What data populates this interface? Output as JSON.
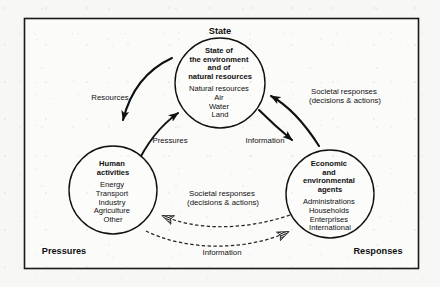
{
  "figure": {
    "frame_color": "#1a1a1a",
    "background_color": "#f7f7f5",
    "text_color": "#111111"
  },
  "corner_labels": {
    "top": "State",
    "bottom_left": "Pressures",
    "bottom_right": "Responses"
  },
  "nodes": [
    {
      "id": "state",
      "heading_lines": [
        "State of",
        "the environment",
        "and of",
        "natural resources"
      ],
      "item_lines": [
        "Natural resources",
        "Air",
        "Water",
        "Land"
      ]
    },
    {
      "id": "human-activities",
      "heading_lines": [
        "Human",
        "activities"
      ],
      "item_lines": [
        "Energy",
        "Transport",
        "Industry",
        "Agriculture",
        "Other"
      ]
    },
    {
      "id": "agents",
      "heading_lines": [
        "Economic",
        "and",
        "environmental",
        "agents"
      ],
      "item_lines": [
        "Administrations",
        "Households",
        "Enterprises",
        "International"
      ]
    }
  ],
  "arrow_labels": {
    "resources": "Resources",
    "pressures": "Pressures",
    "societal_responses_right_line1": "Societal responses",
    "societal_responses_right_line2": "(decisions & actions)",
    "information_right": "Information",
    "societal_responses_bottom_line1": "Societal responses",
    "societal_responses_bottom_line2": "(decisions & actions)",
    "information_bottom": "Information"
  }
}
